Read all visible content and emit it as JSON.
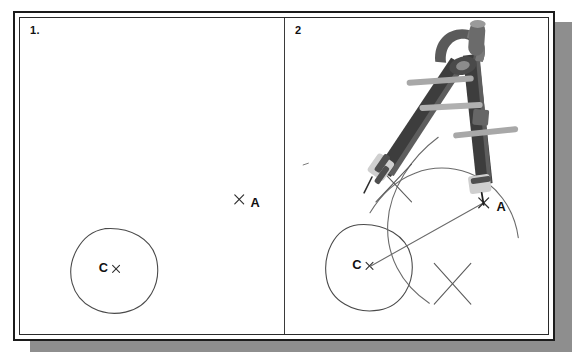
{
  "figure": {
    "panels": [
      {
        "number": "1.",
        "name": "step-one",
        "elements": {
          "circle_label": "C",
          "point_label": "A",
          "circle_center_mark": "x",
          "point_a_mark": "x"
        },
        "geometry": {
          "circle": {
            "cx": 100,
            "cy": 275,
            "rx": 47,
            "ry": 43
          },
          "point_a": {
            "x": 236,
            "y": 208
          }
        }
      },
      {
        "number": "2",
        "name": "step-two",
        "elements": {
          "circle_label": "C",
          "point_label": "A",
          "circle_center_mark": "x",
          "point_a_mark": "x",
          "tool": "drawing-compass"
        },
        "geometry": {
          "circle": {
            "cx": 373,
            "cy": 272,
            "rx": 48,
            "ry": 45
          },
          "point_a": {
            "x": 508,
            "y": 207
          },
          "line_c_to_a": {
            "x1": 374,
            "y1": 273,
            "x2": 508,
            "y2": 207
          },
          "arc_intersections": [
            {
              "x": 412,
              "y": 187
            },
            {
              "x": 475,
              "y": 288
            }
          ]
        }
      }
    ]
  },
  "colors": {
    "ink": "#111111",
    "pencil_line": "#5a5a5a",
    "frame": "#1c1c1c",
    "shadow": "#8e8e8e",
    "compass_dark": "#3a3a3a",
    "compass_mid": "#6f6f6f",
    "compass_light": "#b4b4b4",
    "paper": "#ffffff"
  }
}
